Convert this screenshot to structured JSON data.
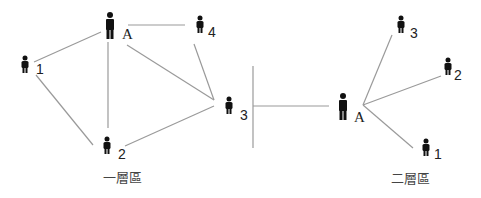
{
  "diagram": {
    "left": {
      "caption": "一層區",
      "nodes": [
        {
          "id": "A",
          "label": "A",
          "role": "self"
        },
        {
          "id": "1",
          "label": "1"
        },
        {
          "id": "2",
          "label": "2"
        },
        {
          "id": "3",
          "label": "3"
        },
        {
          "id": "4",
          "label": "4"
        }
      ],
      "edges": [
        [
          "A",
          "1"
        ],
        [
          "A",
          "2"
        ],
        [
          "A",
          "3"
        ],
        [
          "A",
          "4"
        ],
        [
          "1",
          "2"
        ],
        [
          "2",
          "3"
        ],
        [
          "3",
          "4"
        ]
      ]
    },
    "right": {
      "caption": "二層區",
      "nodes": [
        {
          "id": "A",
          "label": "A",
          "role": "self"
        },
        {
          "id": "1",
          "label": "1"
        },
        {
          "id": "2",
          "label": "2"
        },
        {
          "id": "3",
          "label": "3"
        }
      ],
      "edges": [
        [
          "A",
          "1"
        ],
        [
          "A",
          "2"
        ],
        [
          "A",
          "3"
        ]
      ]
    },
    "separator": "cross",
    "colors": {
      "line": "#9a9a9a",
      "figure": "#111111"
    }
  }
}
